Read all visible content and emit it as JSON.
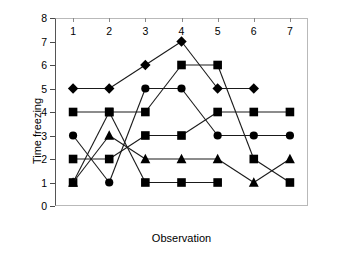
{
  "chart_data": {
    "type": "line",
    "title": "",
    "xlabel": "Observation",
    "ylabel": "Time freezing",
    "x": [
      1,
      2,
      3,
      4,
      5,
      6,
      7
    ],
    "categories": [
      "1",
      "2",
      "3",
      "4",
      "5",
      "6",
      "7"
    ],
    "xlim": [
      0.5,
      7.5
    ],
    "ylim": [
      0,
      8
    ],
    "yticks": [
      0,
      1,
      2,
      3,
      4,
      5,
      6,
      7,
      8
    ],
    "ytick_labels": [
      "0",
      "1",
      "2",
      "3",
      "4",
      "5",
      "6",
      "7",
      "8"
    ],
    "grid": false,
    "legend": "none",
    "marker_color": "#000000",
    "line_color": "#1a1a1a",
    "series": [
      {
        "name": "Series 1",
        "marker": "diamond",
        "values": [
          5,
          5,
          6,
          7,
          5,
          5,
          null
        ]
      },
      {
        "name": "Series 2",
        "marker": "square",
        "values": [
          4,
          4,
          4,
          6,
          6,
          2,
          1
        ]
      },
      {
        "name": "Series 3",
        "marker": "circle",
        "values": [
          3,
          1,
          5,
          5,
          3,
          3,
          3
        ]
      },
      {
        "name": "Series 4",
        "marker": "square",
        "values": [
          2,
          2,
          3,
          3,
          4,
          4,
          4
        ]
      },
      {
        "name": "Series 5",
        "marker": "square",
        "values": [
          1,
          4,
          1,
          1,
          1,
          null,
          null
        ]
      },
      {
        "name": "Series 6",
        "marker": "triangle",
        "values": [
          1,
          3,
          2,
          2,
          2,
          1,
          2
        ]
      }
    ]
  },
  "axes": {
    "y_title": "Time freezing",
    "x_title": "Observation"
  }
}
